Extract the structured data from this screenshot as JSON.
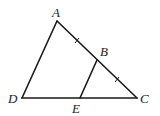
{
  "diagram": {
    "type": "geometry",
    "points": {
      "A": {
        "label": "A",
        "x": 57,
        "y": 21,
        "lx": 52,
        "ly": 17
      },
      "B": {
        "label": "B",
        "x": 97,
        "y": 60,
        "lx": 100,
        "ly": 56
      },
      "C": {
        "label": "C",
        "x": 137,
        "y": 98,
        "lx": 140,
        "ly": 103
      },
      "D": {
        "label": "D",
        "x": 22,
        "y": 98,
        "lx": 8,
        "ly": 103
      },
      "E": {
        "label": "E",
        "x": 80,
        "y": 98,
        "lx": 72,
        "ly": 113
      }
    },
    "segments": [
      {
        "from": "A",
        "to": "C",
        "name": "side-ac"
      },
      {
        "from": "A",
        "to": "D",
        "name": "side-ad"
      },
      {
        "from": "D",
        "to": "C",
        "name": "side-dc"
      },
      {
        "from": "B",
        "to": "E",
        "name": "segment-be"
      }
    ],
    "tick_marks": [
      {
        "segment": "AB",
        "x": 77,
        "y": 40
      },
      {
        "segment": "BC",
        "x": 117,
        "y": 79
      }
    ],
    "line_color": "#1a1a1a"
  }
}
